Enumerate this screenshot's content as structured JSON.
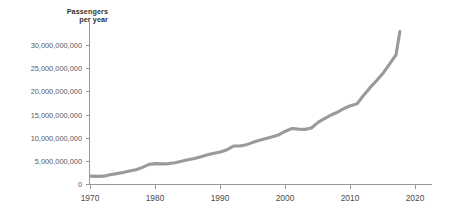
{
  "chart_data": {
    "type": "line",
    "title": "",
    "ylabel_lines": [
      "Passengers",
      "per year"
    ],
    "xlabel": "",
    "ylabel": "Passengers per year",
    "xlim": [
      1966,
      2022
    ],
    "ylim": [
      0,
      33500000000
    ],
    "grid": false,
    "legend": "none",
    "line_color": "#9a9a9a",
    "axis_color": "#8d8d8d",
    "y_ticks": [
      0,
      5000000000,
      10000000000,
      15000000000,
      20000000000,
      25000000000,
      30000000000
    ],
    "y_tick_labels": [
      "0",
      "5,000,000,000",
      "10,000,000,000",
      "15,000,000,000",
      "20,000,000,000",
      "25,000,000,000",
      "30,000,000,000"
    ],
    "x_ticks": [
      1970,
      1980,
      1990,
      2000,
      2010,
      2020
    ],
    "x_tick_labels": [
      "1970",
      "1980",
      "1990",
      "2000",
      "2010",
      "2020"
    ],
    "series": [
      {
        "name": "Passengers per year",
        "x": [
          1970,
          1971,
          1972,
          1973,
          1974,
          1975,
          1976,
          1977,
          1978,
          1979,
          1980,
          1981,
          1982,
          1983,
          1984,
          1985,
          1986,
          1987,
          1988,
          1989,
          1990,
          1991,
          1992,
          1993,
          1994,
          1995,
          1996,
          1997,
          1998,
          1999,
          2000,
          2001,
          2002,
          2003,
          2004,
          2005,
          2006,
          2007,
          2008,
          2009,
          2010,
          2011,
          2012,
          2013,
          2014,
          2015,
          2016,
          2017
        ],
        "values": [
          1800000000,
          1750000000,
          1800000000,
          2100000000,
          2350000000,
          2600000000,
          2900000000,
          3200000000,
          3700000000,
          4350000000,
          4500000000,
          4450000000,
          4500000000,
          4700000000,
          5000000000,
          5350000000,
          5600000000,
          6000000000,
          6400000000,
          6750000000,
          7000000000,
          7500000000,
          8300000000,
          8300000000,
          8600000000,
          9100000000,
          9550000000,
          9950000000,
          10300000000,
          10750000000,
          11500000000,
          12100000000,
          11950000000,
          11900000000,
          12200000000,
          13400000000,
          14200000000,
          15000000000,
          15600000000,
          16400000000,
          17000000000,
          17400000000,
          19200000000,
          20900000000,
          22400000000,
          24000000000,
          26000000000,
          28000000000
        ],
        "final_value": 33000000000,
        "final_year": 2017.6
      }
    ],
    "annotations": [
      {
        "label": "plateau",
        "period": "1991-1993"
      },
      {
        "label": "plateau",
        "period": "2001-2003"
      },
      {
        "label": "plateau",
        "period": "2008-2011"
      }
    ]
  }
}
